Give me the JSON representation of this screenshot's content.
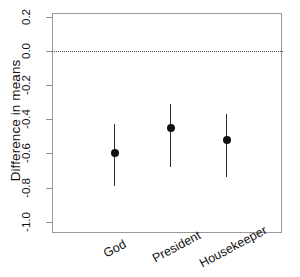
{
  "chart_data": {
    "type": "scatter",
    "title": "",
    "subtitle": "",
    "xlabel": "",
    "ylabel": "Difference in means",
    "categories": [
      "God",
      "President",
      "Housekeeper"
    ],
    "values": [
      -0.6,
      -0.45,
      -0.52
    ],
    "error_low": [
      -0.79,
      -0.68,
      -0.74
    ],
    "error_high": [
      -0.43,
      -0.31,
      -0.37
    ],
    "series": [
      {
        "name": "Difference in means",
        "values": [
          -0.6,
          -0.45,
          -0.52
        ],
        "ci_lower": [
          -0.79,
          -0.68,
          -0.74
        ],
        "ci_upper": [
          -0.43,
          -0.31,
          -0.37
        ]
      }
    ],
    "ylim": [
      -1.0,
      0.2
    ],
    "ytick_labels": [
      "0.2",
      "0.0",
      "-0.2",
      "-0.4",
      "-0.6",
      "-0.8",
      "-1.0"
    ],
    "ytick_values": [
      0.2,
      0.0,
      -0.2,
      -0.4,
      -0.6,
      -0.8,
      -1.0
    ],
    "reference_line": {
      "value": 0.0,
      "style": "dotted",
      "color": "#4a4a4a"
    },
    "grid": false,
    "legend": false,
    "legend_position": "none",
    "point_color": "#111111",
    "whisker_color": "#2b2b2b",
    "axis_color": "#9a9a9a",
    "xlabel_rotation": -28
  }
}
